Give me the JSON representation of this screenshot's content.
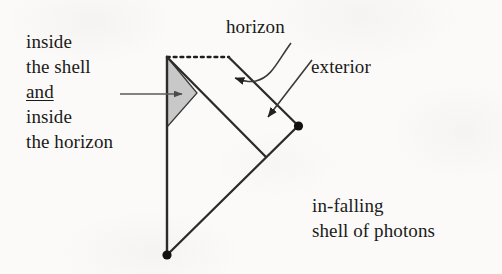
{
  "figure": {
    "kind": "spacetime-penrose-diagram",
    "canvas": {
      "width": 502,
      "height": 274
    },
    "colors": {
      "background": "#fbfaf8",
      "ink": "#1a1a1a",
      "line": "#2b2b2b",
      "arrow": "#555555",
      "shaded_region_fill": "#c8c8c8",
      "shaded_region_stroke": "#3a3a3a"
    },
    "labels": {
      "inside_shell_and_horizon": {
        "line1": "inside",
        "line2": "the shell",
        "line3_underlined": "and",
        "line4": "inside",
        "line5": "the horizon"
      },
      "horizon": "horizon",
      "exterior": "exterior",
      "infalling_shell": {
        "line1": "in-falling",
        "line2": "shell of photons"
      }
    },
    "geometry": {
      "vertical_axis": {
        "x": 167,
        "y_top": 57,
        "y_bottom": 255
      },
      "dotted_horizon_segment": {
        "x1": 167,
        "y1": 57,
        "x2": 228,
        "y2": 57
      },
      "shaded_triangle_points": "167,57 197,93 167,127",
      "photon_shell_line": {
        "x1": 167,
        "y1": 255,
        "x2": 298,
        "y2": 126
      },
      "inner_null_line": {
        "x1": 167,
        "y1": 57,
        "x2": 265,
        "y2": 156
      },
      "outer_null_line": {
        "x1": 228,
        "y1": 57,
        "x2": 298,
        "y2": 126
      },
      "dots": [
        {
          "name": "origin-dot",
          "cx": 167,
          "cy": 255,
          "r": 4.6
        },
        {
          "name": "shell-emission-dot",
          "cx": 298,
          "cy": 126,
          "r": 4.6
        }
      ],
      "arrows": [
        {
          "name": "arrow-to-shaded-region",
          "from": [
            120,
            94
          ],
          "to": [
            181,
            94
          ],
          "style": "straight"
        },
        {
          "name": "arrow-to-horizon",
          "from": [
            291,
            44
          ],
          "to": [
            232,
            78
          ],
          "style": "curved"
        },
        {
          "name": "arrow-to-exterior",
          "from": [
            311,
            62
          ],
          "to": [
            267,
            119
          ],
          "style": "straight"
        }
      ]
    }
  }
}
